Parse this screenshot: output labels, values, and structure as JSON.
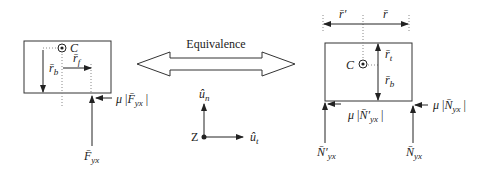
{
  "figure": {
    "left_body": {
      "center_label": "C",
      "r_b_label": "r̄",
      "r_b_sub": "b",
      "r_f_label": "r̄",
      "r_f_sub": "f",
      "friction_label_mu": "μ",
      "friction_label_F": "F̄",
      "friction_sub": "yx",
      "normal_label": "F̄",
      "normal_sub": "yx"
    },
    "equivalence_label": "Equivalence",
    "axes": {
      "origin_label": "Z",
      "normal_axis_label": "û",
      "normal_axis_sub": "n",
      "tangent_axis_label": "û",
      "tangent_axis_sub": "t"
    },
    "right_body": {
      "center_label": "C",
      "r_prime_label": "r̄′",
      "r_label": "r̄",
      "r_t_label": "r̄",
      "r_t_sub": "t",
      "r_b_label": "r̄",
      "r_b_sub": "b",
      "friction_left_mu": "μ",
      "friction_left_N": "N̄′",
      "friction_left_sub": "yx",
      "friction_right_mu": "μ",
      "friction_right_N": "N̄",
      "friction_right_sub": "yx",
      "normal_left_label": "N̄′",
      "normal_left_sub": "yx",
      "normal_right_label": "N̄",
      "normal_right_sub": "yx"
    }
  }
}
